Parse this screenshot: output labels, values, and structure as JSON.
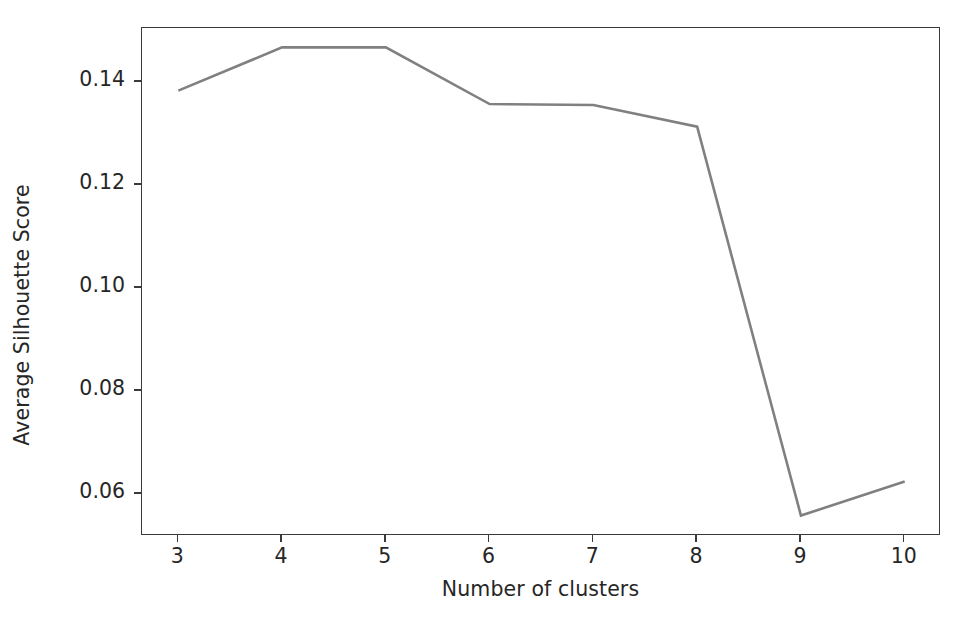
{
  "chart_data": {
    "type": "line",
    "title": "",
    "xlabel": "Number of clusters",
    "ylabel": "Average Silhouette Score",
    "x": [
      3,
      4,
      5,
      6,
      7,
      8,
      9,
      10
    ],
    "values": [
      0.1383,
      0.1467,
      0.1467,
      0.1357,
      0.1355,
      0.1313,
      0.0558,
      0.0624
    ],
    "series": [
      {
        "name": "Average Silhouette Score",
        "values": [
          0.1383,
          0.1467,
          0.1467,
          0.1357,
          0.1355,
          0.1313,
          0.0558,
          0.0624
        ]
      }
    ],
    "xticks": [
      3,
      4,
      5,
      6,
      7,
      8,
      9,
      10
    ],
    "xtick_labels": [
      "3",
      "4",
      "5",
      "6",
      "7",
      "8",
      "9",
      "10"
    ],
    "yticks": [
      0.06,
      0.08,
      0.1,
      0.12,
      0.14
    ],
    "ytick_labels": [
      "0.06",
      "0.08",
      "0.10",
      "0.12",
      "0.14"
    ],
    "xlim": [
      2.65,
      10.35
    ],
    "ylim": [
      0.05183,
      0.15046
    ],
    "grid": false,
    "legend": false,
    "line_color": "#808080",
    "line_width": 2.6,
    "markers": false,
    "axes_color": "#3a3a3a",
    "background_color": "#ffffff",
    "text_color": "#262626"
  }
}
